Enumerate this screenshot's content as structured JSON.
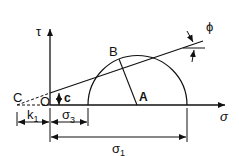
{
  "diagram": {
    "type": "mohr-circle",
    "labels": {
      "tau": "τ",
      "sigma": "σ",
      "phi": "ϕ",
      "B": "B",
      "A": "A",
      "C": "C",
      "O": "O",
      "c": "c",
      "k1": "k",
      "k1_sub": "1",
      "sigma3": "σ",
      "sigma3_sub": "3",
      "sigma1": "σ",
      "sigma1_sub": "1"
    },
    "colors": {
      "stroke": "#111111",
      "background": "#ffffff"
    }
  }
}
